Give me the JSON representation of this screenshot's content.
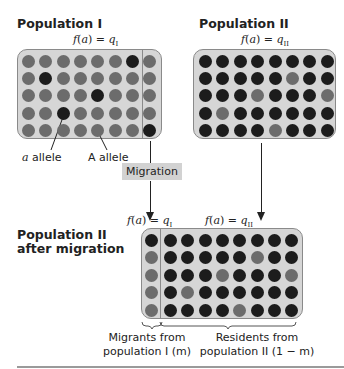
{
  "population_1": {
    "title": "Population I",
    "formula_prefix": "f(a) = q",
    "formula_sub": "I",
    "grid": [
      [
        "A",
        "A",
        "A",
        "A",
        "A",
        "A",
        "a",
        "A"
      ],
      [
        "A",
        "a",
        "A",
        "A",
        "A",
        "A",
        "A",
        "A"
      ],
      [
        "A",
        "A",
        "A",
        "A",
        "a",
        "A",
        "A",
        "A"
      ],
      [
        "A",
        "A",
        "a",
        "A",
        "A",
        "A",
        "A",
        "A"
      ],
      [
        "A",
        "A",
        "A",
        "A",
        "A",
        "A",
        "A",
        "a"
      ]
    ],
    "labels": {
      "a_allele": "allele",
      "a_allele_symbol": "a",
      "A_allele": "A allele"
    }
  },
  "population_2": {
    "title": "Population II",
    "formula_prefix": "f(a) = q",
    "formula_sub": "II",
    "grid": [
      [
        "a",
        "a",
        "a",
        "a",
        "a",
        "a",
        "a",
        "a"
      ],
      [
        "a",
        "a",
        "a",
        "a",
        "a",
        "A",
        "a",
        "a"
      ],
      [
        "a",
        "a",
        "a",
        "A",
        "a",
        "a",
        "a",
        "A"
      ],
      [
        "a",
        "A",
        "a",
        "a",
        "a",
        "a",
        "a",
        "a"
      ],
      [
        "a",
        "a",
        "a",
        "a",
        "A",
        "a",
        "a",
        "a"
      ]
    ]
  },
  "migration_label": "Migration",
  "after_migration": {
    "title_line1": "Population II",
    "title_line2": "after migration",
    "formula_left_prefix": "f(a) = q",
    "formula_left_sub": "I",
    "formula_right_prefix": "f(a) = q",
    "formula_right_sub": "II",
    "migrant_column": [
      "a",
      "A",
      "A",
      "A",
      "A"
    ],
    "caption_migrants_line1": "Migrants from",
    "caption_migrants_line2": "population I (m)",
    "caption_residents_line1": "Residents from",
    "caption_residents_line2": "population II (1 − m)"
  },
  "colors": {
    "box_fill": "#d6d6d6",
    "A_allele_dot": "#6c6c6c",
    "a_allele_dot": "#1c1c1c",
    "migration_label_bg": "#d2d2d2"
  }
}
